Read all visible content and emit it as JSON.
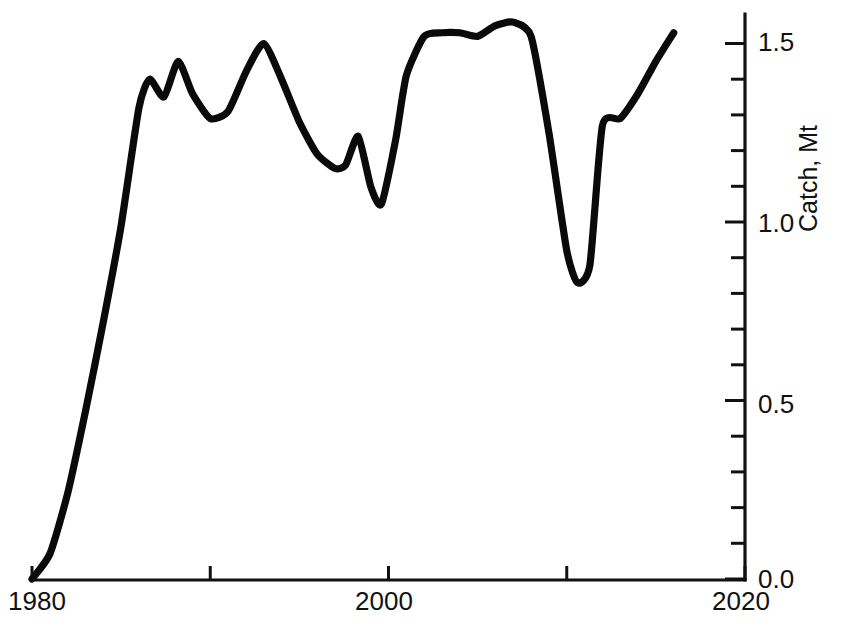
{
  "chart_data": {
    "type": "line",
    "title": "",
    "xlabel": "",
    "ylabel": "Catch, Mt",
    "xlim": [
      1980,
      2020
    ],
    "ylim": [
      0.0,
      1.6
    ],
    "grid": false,
    "legend": null,
    "x_ticks": [
      {
        "value": 1980,
        "label": "1980"
      },
      {
        "value": 1990,
        "label": ""
      },
      {
        "value": 2000,
        "label": "2000"
      },
      {
        "value": 2010,
        "label": ""
      },
      {
        "value": 2020,
        "label": "2020"
      }
    ],
    "y_ticks": [
      {
        "value": 0.0,
        "label": "0.0"
      },
      {
        "value": 0.1,
        "label": ""
      },
      {
        "value": 0.2,
        "label": ""
      },
      {
        "value": 0.3,
        "label": ""
      },
      {
        "value": 0.4,
        "label": ""
      },
      {
        "value": 0.5,
        "label": "0.5"
      },
      {
        "value": 0.6,
        "label": ""
      },
      {
        "value": 0.7,
        "label": ""
      },
      {
        "value": 0.8,
        "label": ""
      },
      {
        "value": 0.9,
        "label": ""
      },
      {
        "value": 1.0,
        "label": "1.0"
      },
      {
        "value": 1.1,
        "label": ""
      },
      {
        "value": 1.2,
        "label": ""
      },
      {
        "value": 1.3,
        "label": ""
      },
      {
        "value": 1.4,
        "label": ""
      },
      {
        "value": 1.5,
        "label": "1.5"
      }
    ],
    "y_axis_position": "right",
    "line_color": "#0a0a0a",
    "axis_color": "#111111",
    "x": [
      1980,
      1981,
      1982,
      1983,
      1984,
      1985,
      1986,
      1986.6,
      1987.4,
      1988.2,
      1989,
      1990,
      1991,
      1992,
      1993,
      1994,
      1995,
      1996,
      1997,
      1997.6,
      1998.3,
      1999,
      1999.6,
      2000.4,
      2001,
      2002,
      2003,
      2004,
      2005,
      2006,
      2007,
      2008,
      2009,
      2010,
      2010.6,
      2011.3,
      2012,
      2013,
      2014,
      2015,
      2016
    ],
    "y": [
      0.0,
      0.07,
      0.24,
      0.47,
      0.72,
      0.99,
      1.32,
      1.4,
      1.35,
      1.45,
      1.36,
      1.29,
      1.31,
      1.42,
      1.5,
      1.4,
      1.28,
      1.19,
      1.15,
      1.16,
      1.24,
      1.1,
      1.05,
      1.23,
      1.41,
      1.52,
      1.53,
      1.53,
      1.52,
      1.55,
      1.56,
      1.52,
      1.25,
      0.92,
      0.83,
      0.88,
      1.27,
      1.29,
      1.36,
      1.45,
      1.53
    ],
    "units": "Mt"
  },
  "axis_labels": {
    "x_min_label": "1980",
    "x_mid_label": "2000",
    "x_max_label": "2020",
    "y_0": "0.0",
    "y_1": "0.5",
    "y_2": "1.0",
    "y_3": "1.5",
    "y_title": "Catch, Mt"
  }
}
